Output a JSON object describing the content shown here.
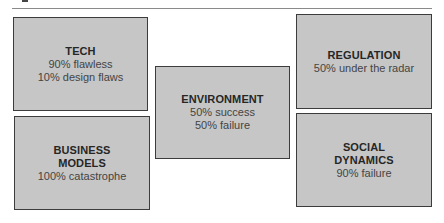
{
  "diagram": {
    "boxes": [
      {
        "id": "tech",
        "title_lines": [
          "TECH"
        ],
        "lines": [
          "90% flawless",
          "10% design flaws"
        ]
      },
      {
        "id": "business-models",
        "title_lines": [
          "BUSINESS",
          "MODELS"
        ],
        "lines": [
          "100% catastrophe"
        ]
      },
      {
        "id": "environment",
        "title_lines": [
          "ENVIRONMENT"
        ],
        "lines": [
          "50% success",
          "50% failure"
        ]
      },
      {
        "id": "regulation",
        "title_lines": [
          "REGULATION"
        ],
        "lines": [
          "50% under the radar"
        ]
      },
      {
        "id": "social-dynamics",
        "title_lines": [
          "SOCIAL",
          "DYNAMICS"
        ],
        "lines": [
          "90% failure"
        ]
      }
    ],
    "colors": {
      "box_fill": "#c6c6c6",
      "box_border": "#3c3c3c",
      "title_text": "#262626",
      "body_text": "#444444",
      "rule": "#8a8a8a"
    }
  }
}
